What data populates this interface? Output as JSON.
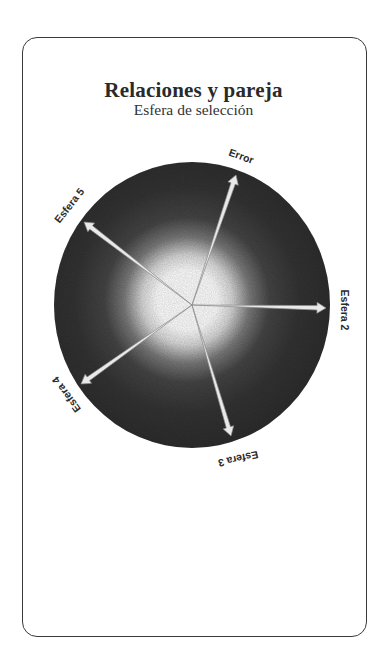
{
  "card": {
    "title": "Relaciones y pareja",
    "subtitle": "Esfera de selección"
  },
  "sphere": {
    "center": [
      192,
      305
    ],
    "radius_x": 138,
    "radius_y": 143,
    "disc_color": "#2e2e2e",
    "glow_color": "#ffffff",
    "arrows": [
      {
        "id": "error",
        "label": "Error",
        "tip": [
          236,
          175
        ],
        "label_pos": [
          241,
          157
        ],
        "label_rotate": 20
      },
      {
        "id": "esfera-2",
        "label": "Esfera 2",
        "tip": [
          326,
          308
        ],
        "label_pos": [
          344,
          310
        ],
        "label_rotate": 90
      },
      {
        "id": "esfera-3",
        "label": "Esfera 3",
        "tip": [
          231,
          436
        ],
        "label_pos": [
          238,
          458
        ],
        "label_rotate": 167
      },
      {
        "id": "esfera-4",
        "label": "Esfera 4",
        "tip": [
          81,
          384
        ],
        "label_pos": [
          67,
          394
        ],
        "label_rotate": 234
      },
      {
        "id": "esfera-5",
        "label": "Esfera 5",
        "tip": [
          84,
          222
        ],
        "label_pos": [
          70,
          206
        ],
        "label_rotate": -52
      }
    ]
  }
}
